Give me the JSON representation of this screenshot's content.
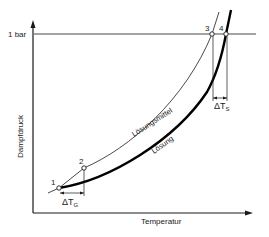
{
  "diagram": {
    "y_axis": {
      "label": "Dampfdruck",
      "reference_label": "1 bar"
    },
    "x_axis": {
      "label": "Temperatur"
    },
    "curves": [
      {
        "name": "Lösungsmittel",
        "style": "thin"
      },
      {
        "name": "Lösung",
        "style": "thick"
      }
    ],
    "points": [
      {
        "label": "1"
      },
      {
        "label": "2"
      },
      {
        "label": "3"
      },
      {
        "label": "4"
      }
    ],
    "deltas": [
      {
        "symbol": "ΔT",
        "subscript": "G"
      },
      {
        "symbol": "ΔT",
        "subscript": "S"
      }
    ],
    "colors": {
      "line": "#1a1a1a",
      "background": "#ffffff"
    }
  }
}
